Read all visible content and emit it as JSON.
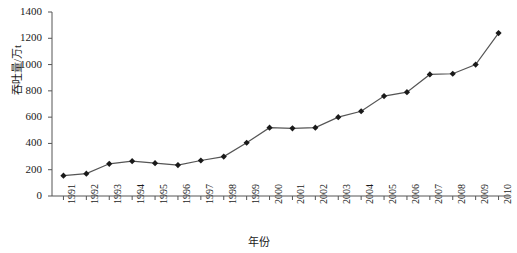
{
  "chart_data": {
    "type": "line",
    "title": "",
    "xlabel": "年份",
    "ylabel": "吞吐量/万t",
    "categories": [
      "1991",
      "1992",
      "1993",
      "1994",
      "1995",
      "1996",
      "1997",
      "1998",
      "1999",
      "2000",
      "2001",
      "2002",
      "2003",
      "2004",
      "2005",
      "2006",
      "2007",
      "2008",
      "2009",
      "2010"
    ],
    "values": [
      155,
      170,
      245,
      265,
      250,
      235,
      270,
      300,
      405,
      520,
      515,
      520,
      600,
      645,
      760,
      790,
      925,
      930,
      1000,
      1240
    ],
    "series": [
      {
        "name": "吞吐量",
        "values": [
          155,
          170,
          245,
          265,
          250,
          235,
          270,
          300,
          405,
          520,
          515,
          520,
          600,
          645,
          760,
          790,
          925,
          930,
          1000,
          1240
        ]
      }
    ],
    "ylim": [
      0,
      1400
    ],
    "yticks": [
      0,
      200,
      400,
      600,
      800,
      1000,
      1200,
      1400
    ],
    "ytick_labels": [
      "0",
      "200",
      "400",
      "600",
      "800",
      "1000",
      "1200",
      "1400"
    ],
    "grid": false,
    "legend": "none",
    "marker": "diamond",
    "line_color": "#555555",
    "marker_color": "#1a1a1a",
    "axis_color": "#555555"
  }
}
